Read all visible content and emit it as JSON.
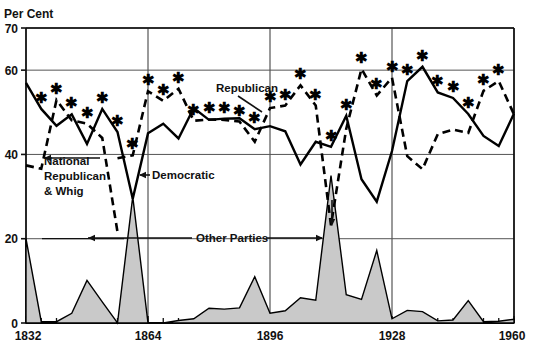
{
  "chart_data": {
    "type": "line",
    "title": "",
    "xlabel": "",
    "ylabel": "Per Cent",
    "ylim": [
      0,
      70
    ],
    "xlim": [
      1832,
      1960
    ],
    "yticks": [
      0,
      20,
      40,
      60,
      70
    ],
    "xticks": [
      1832,
      1864,
      1896,
      1928,
      1960
    ],
    "xtick_step_minor": 4,
    "grid": true,
    "gridlines_y": [
      20,
      40,
      60,
      70
    ],
    "gridlines_x": [
      1864,
      1896,
      1928
    ],
    "legend_position": "inline-annotations",
    "annotations": [
      {
        "text": "Per Cent",
        "name": "y-axis-unit-label"
      },
      {
        "text": "National Republican & Whig",
        "name": "series-label-whig"
      },
      {
        "text": "Democratic",
        "name": "series-label-democratic"
      },
      {
        "text": "Republican",
        "name": "series-label-republican"
      },
      {
        "text": "Other Parties",
        "name": "series-label-other"
      }
    ],
    "star_note": "* marks winning party's share",
    "x": [
      1832,
      1836,
      1840,
      1844,
      1848,
      1852,
      1856,
      1860,
      1864,
      1868,
      1872,
      1876,
      1880,
      1884,
      1888,
      1892,
      1896,
      1900,
      1904,
      1908,
      1912,
      1916,
      1920,
      1924,
      1928,
      1932,
      1936,
      1940,
      1944,
      1948,
      1952,
      1956,
      1960
    ],
    "series": [
      {
        "name": "Democratic",
        "style": "solid",
        "values": [
          57.0,
          50.8,
          46.8,
          49.5,
          42.5,
          50.8,
          45.3,
          29.5,
          45.0,
          47.3,
          43.8,
          51.0,
          48.2,
          48.5,
          48.6,
          46.0,
          46.7,
          45.5,
          37.6,
          43.0,
          41.8,
          49.2,
          34.1,
          28.8,
          40.8,
          57.4,
          60.8,
          54.7,
          53.4,
          49.6,
          44.4,
          42.0,
          49.7
        ]
      },
      {
        "name": "Republican",
        "style": "dashed",
        "values": [
          null,
          null,
          null,
          null,
          null,
          null,
          39.1,
          39.8,
          55.0,
          52.7,
          55.6,
          48.0,
          48.3,
          48.2,
          47.8,
          43.0,
          51.0,
          51.6,
          56.4,
          51.6,
          23.2,
          46.1,
          60.3,
          54.0,
          58.2,
          39.6,
          36.5,
          44.8,
          45.9,
          45.1,
          55.1,
          57.4,
          49.5
        ]
      },
      {
        "name": "National Republican & Whig",
        "style": "dashed",
        "values": [
          37.4,
          36.6,
          52.9,
          48.1,
          47.3,
          43.9,
          21.6,
          null,
          null,
          null,
          null,
          null,
          null,
          null,
          null,
          null,
          null,
          null,
          null,
          null,
          null,
          null,
          null,
          null,
          null,
          null,
          null,
          null,
          null,
          null,
          null,
          null,
          null
        ]
      },
      {
        "name": "Other Parties",
        "style": "filled-area",
        "values": [
          20.0,
          0.3,
          0.3,
          2.3,
          10.1,
          5.0,
          0.0,
          30.0,
          0.0,
          0.0,
          0.6,
          1.0,
          3.5,
          3.3,
          3.6,
          11.0,
          2.3,
          2.9,
          6.0,
          5.4,
          35.0,
          6.7,
          5.6,
          17.2,
          1.0,
          3.0,
          2.7,
          0.5,
          0.7,
          5.3,
          0.3,
          0.4,
          0.9
        ]
      }
    ],
    "star_markers": [
      {
        "year": 1836,
        "value": 50.8
      },
      {
        "year": 1840,
        "value": 52.9
      },
      {
        "year": 1844,
        "value": 49.5
      },
      {
        "year": 1848,
        "value": 47.3
      },
      {
        "year": 1852,
        "value": 50.8
      },
      {
        "year": 1856,
        "value": 45.3
      },
      {
        "year": 1860,
        "value": 39.8
      },
      {
        "year": 1864,
        "value": 55.0
      },
      {
        "year": 1868,
        "value": 52.7
      },
      {
        "year": 1872,
        "value": 55.6
      },
      {
        "year": 1876,
        "value": 48.0
      },
      {
        "year": 1880,
        "value": 48.3
      },
      {
        "year": 1884,
        "value": 48.5
      },
      {
        "year": 1888,
        "value": 47.8
      },
      {
        "year": 1892,
        "value": 46.0
      },
      {
        "year": 1896,
        "value": 51.0
      },
      {
        "year": 1900,
        "value": 51.6
      },
      {
        "year": 1904,
        "value": 56.4
      },
      {
        "year": 1908,
        "value": 51.6
      },
      {
        "year": 1912,
        "value": 41.8
      },
      {
        "year": 1916,
        "value": 49.2
      },
      {
        "year": 1920,
        "value": 60.3
      },
      {
        "year": 1924,
        "value": 54.0
      },
      {
        "year": 1928,
        "value": 58.2
      },
      {
        "year": 1932,
        "value": 57.4
      },
      {
        "year": 1936,
        "value": 60.8
      },
      {
        "year": 1940,
        "value": 54.7
      },
      {
        "year": 1944,
        "value": 53.4
      },
      {
        "year": 1948,
        "value": 49.6
      },
      {
        "year": 1952,
        "value": 55.1
      },
      {
        "year": 1956,
        "value": 57.4
      }
    ]
  },
  "axis": {
    "y_unit": "Per Cent",
    "y_ticks": [
      "70",
      "60",
      "40",
      "20",
      "0"
    ],
    "x_ticks": [
      "1832",
      "1864",
      "1896",
      "1928",
      "1960"
    ]
  },
  "labels": {
    "whig_line1": "National",
    "whig_line2": "Republican",
    "whig_line3": "& Whig",
    "democratic": "Democratic",
    "republican": "Republican",
    "other_parties": "Other Parties"
  },
  "colors": {
    "line": "#000000",
    "grid": "#555555",
    "area_fill": "#c9c9c9",
    "background": "#ffffff"
  }
}
